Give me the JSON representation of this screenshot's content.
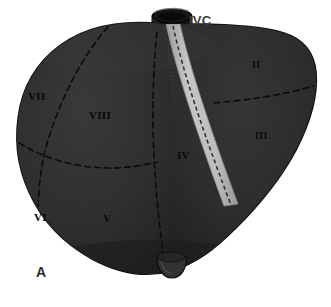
{
  "figure": {
    "panel_label": "A",
    "panel_label_pos": {
      "x": 36,
      "y": 265
    },
    "background_color": "#ffffff",
    "liver_body_color": "#2f2f2f",
    "liver_shadow_color": "#242424",
    "liver_outline_color": "#141414",
    "ligament_color": "#b9b9b9",
    "ligament_edge_color": "#8e8e8e",
    "ivc_color": "#1a1a1a",
    "ivc_highlight_color": "#6e6e6e",
    "gallbladder_color": "#303030",
    "dashed_line_color": "#0a0a0a"
  },
  "callouts": [
    {
      "id": "ivc",
      "text": "IVC",
      "name": "label-ivc",
      "x": 189,
      "y": 14
    }
  ],
  "segments": [
    {
      "id": "seg-2",
      "text": "II",
      "name": "segment-label-ii",
      "x": 252,
      "y": 60,
      "size": "small"
    },
    {
      "id": "seg-3",
      "text": "III",
      "name": "segment-label-iii",
      "x": 255,
      "y": 131,
      "size": "small"
    },
    {
      "id": "seg-4",
      "text": "IV",
      "name": "segment-label-iv",
      "x": 177,
      "y": 150,
      "size": "normal"
    },
    {
      "id": "seg-5",
      "text": "V",
      "name": "segment-label-v",
      "x": 103,
      "y": 213,
      "size": "normal"
    },
    {
      "id": "seg-6",
      "text": "VI",
      "name": "segment-label-vi",
      "x": 34,
      "y": 212,
      "size": "normal"
    },
    {
      "id": "seg-7",
      "text": "VII",
      "name": "segment-label-vii",
      "x": 28,
      "y": 91,
      "size": "normal"
    },
    {
      "id": "seg-8",
      "text": "VIII",
      "name": "segment-label-viii",
      "x": 89,
      "y": 110,
      "size": "normal"
    }
  ]
}
